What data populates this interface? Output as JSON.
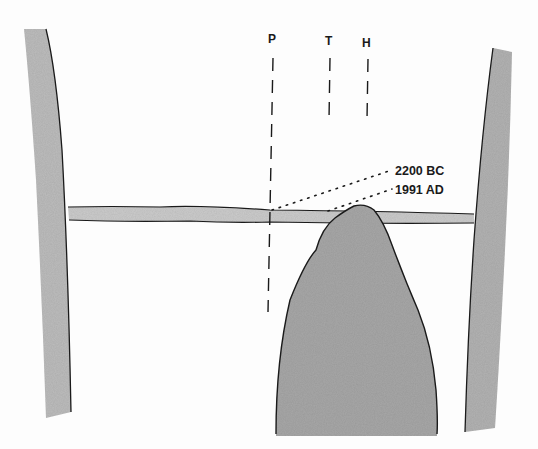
{
  "diagram": {
    "type": "alignment-sketch",
    "colors": {
      "background": "#fdfdfd",
      "stone": "#b8b8b8",
      "stone_dark": "#a6a6a6",
      "lintel": "#c9c9c9",
      "outline": "#1a1a1a"
    },
    "sight_lines": [
      {
        "label": "P"
      },
      {
        "label": "T"
      },
      {
        "label": "H"
      }
    ],
    "annotations": [
      {
        "label": "2200 BC"
      },
      {
        "label": "1991 AD"
      }
    ]
  }
}
